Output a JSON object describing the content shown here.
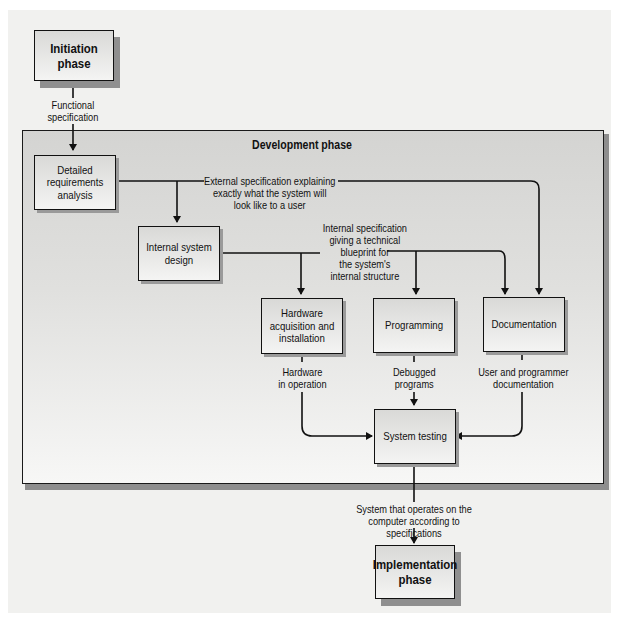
{
  "diagram": {
    "outer_phases": {
      "initiation": "Initiation phase",
      "implementation": "Implementation phase"
    },
    "development": {
      "title": "Development phase",
      "boxes": {
        "requirements": "Detailed requirements analysis",
        "internal_design": "Internal system design",
        "hardware": "Hardware acquisition and installation",
        "programming": "Programming",
        "documentation": "Documentation",
        "testing": "System testing"
      }
    },
    "flows": {
      "functional_spec": "Functional\nspecification",
      "external_spec": "External specification explaining\nexactly what the system will\nlook like to a user",
      "internal_spec": "Internal specification\ngiving a technical\nblueprint for\nthe system's\ninternal structure",
      "hardware_out": "Hardware\nin operation",
      "programs_out": "Debugged\nprograms",
      "docs_out": "User and programmer\ndocumentation",
      "final_out": "System that operates on the\ncomputer according to specifications"
    },
    "colors": {
      "line": "#111111",
      "panel": "#dcdcda",
      "shadow": "#8e8e8e"
    }
  }
}
